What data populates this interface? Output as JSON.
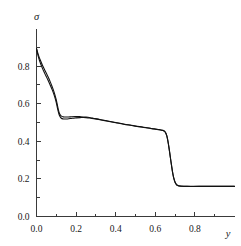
{
  "chart_data": {
    "type": "line",
    "title": "",
    "subtitle": "",
    "xlabel": "y",
    "ylabel": "σ",
    "xlim": [
      0.0,
      1.0
    ],
    "ylim": [
      0.0,
      1.0
    ],
    "xticks": [
      0.0,
      0.2,
      0.4,
      0.6,
      0.8
    ],
    "xtick_labels": [
      "0.0",
      "0.2",
      "0.4",
      "0.6",
      "0.8"
    ],
    "yticks": [
      0.0,
      0.2,
      0.4,
      0.6,
      0.8
    ],
    "ytick_labels": [
      "0.0",
      "0.2",
      "0.4",
      "0.6",
      "0.8"
    ],
    "minor_xticks": [
      0.1,
      0.3,
      0.5,
      0.7,
      0.9
    ],
    "minor_yticks": [
      0.1,
      0.3,
      0.5,
      0.7,
      0.9
    ],
    "grid": false,
    "legend": false,
    "legend_position": "none",
    "annotations": [],
    "series": [
      {
        "name": "curve-1",
        "color": "#111111",
        "x": [
          0.0,
          0.005,
          0.012,
          0.02,
          0.03,
          0.042,
          0.055,
          0.068,
          0.08,
          0.09,
          0.098,
          0.104,
          0.11,
          0.116,
          0.124,
          0.135,
          0.15,
          0.17,
          0.195,
          0.22,
          0.25,
          0.28,
          0.32,
          0.36,
          0.4,
          0.44,
          0.48,
          0.52,
          0.56,
          0.595,
          0.62,
          0.635,
          0.645,
          0.652,
          0.658,
          0.664,
          0.67,
          0.676,
          0.682,
          0.688,
          0.695,
          0.705,
          0.72,
          0.76,
          0.82,
          0.9,
          0.96,
          1.0
        ],
        "y": [
          0.893,
          0.875,
          0.852,
          0.83,
          0.805,
          0.778,
          0.75,
          0.72,
          0.688,
          0.658,
          0.628,
          0.6,
          0.57,
          0.548,
          0.535,
          0.53,
          0.529,
          0.53,
          0.531,
          0.531,
          0.529,
          0.524,
          0.516,
          0.508,
          0.5,
          0.492,
          0.485,
          0.478,
          0.472,
          0.466,
          0.462,
          0.459,
          0.455,
          0.446,
          0.43,
          0.4,
          0.36,
          0.315,
          0.272,
          0.232,
          0.198,
          0.173,
          0.163,
          0.161,
          0.161,
          0.161,
          0.161,
          0.161
        ]
      },
      {
        "name": "curve-2",
        "color": "#111111",
        "x": [
          0.0,
          0.005,
          0.012,
          0.02,
          0.03,
          0.042,
          0.055,
          0.068,
          0.08,
          0.09,
          0.098,
          0.104,
          0.11,
          0.116,
          0.124,
          0.135,
          0.15,
          0.17,
          0.195,
          0.22,
          0.25,
          0.28,
          0.32,
          0.36,
          0.4,
          0.44,
          0.48,
          0.52,
          0.56,
          0.595,
          0.62,
          0.635,
          0.645,
          0.652,
          0.658,
          0.664,
          0.67,
          0.676,
          0.682,
          0.688,
          0.695,
          0.705,
          0.72,
          0.76,
          0.82,
          0.9,
          0.96,
          1.0
        ],
        "y": [
          0.893,
          0.868,
          0.84,
          0.815,
          0.788,
          0.76,
          0.732,
          0.702,
          0.672,
          0.643,
          0.614,
          0.586,
          0.558,
          0.537,
          0.524,
          0.519,
          0.519,
          0.521,
          0.524,
          0.526,
          0.526,
          0.522,
          0.515,
          0.507,
          0.499,
          0.491,
          0.484,
          0.477,
          0.471,
          0.465,
          0.461,
          0.458,
          0.454,
          0.445,
          0.429,
          0.399,
          0.359,
          0.314,
          0.271,
          0.231,
          0.197,
          0.172,
          0.162,
          0.16,
          0.16,
          0.16,
          0.16,
          0.16
        ]
      }
    ]
  },
  "axes": {
    "y_axis_label": "σ",
    "x_axis_label": "y"
  }
}
